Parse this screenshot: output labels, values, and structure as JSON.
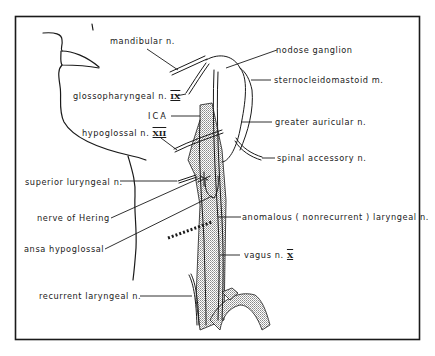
{
  "figure": {
    "type": "anatomical line drawing",
    "colors": {
      "ink": "#1a1a1a",
      "stipple": "#9a9a9a",
      "background": "#ffffff"
    }
  },
  "labels": {
    "mandibular": "mandibular n.",
    "nodose": "nodose ganglion",
    "scm": "sternocleidomastoid m.",
    "glosso_text": "glossopharyngeal n.",
    "glosso_roman": "IX",
    "ica": "ICA",
    "greater_auricular": "greater auricular n.",
    "hypo_text": "hypoglossal n.",
    "hypo_roman": "XII",
    "spinal_accessory": "spinal accessory n.",
    "superior_laryngeal": "superior luryngeal n.",
    "nerve_of_hering": "nerve of Hering",
    "anomalous": "anomalous ( nonrecurrent ) laryngeal n.",
    "ansa": "ansa hypoglossal",
    "vagus_text": "vagus n.",
    "vagus_roman": "X",
    "recurrent": "recurrent laryngeal n."
  }
}
